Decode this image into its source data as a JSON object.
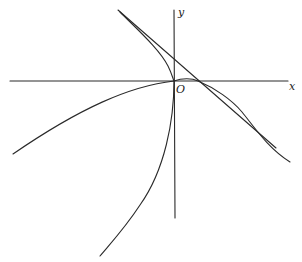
{
  "figure": {
    "type": "curve-sketch",
    "labels": {
      "x_axis": "x",
      "y_axis": "y",
      "origin": "O"
    },
    "colors": {
      "stroke": "#2a2a2a",
      "background": "#ffffff"
    },
    "elements": [
      {
        "name": "x-axis",
        "kind": "axis"
      },
      {
        "name": "y-axis",
        "kind": "axis"
      },
      {
        "name": "tangent-line",
        "kind": "straight line crossing x-axis right of origin"
      },
      {
        "name": "upper-right-branch",
        "kind": "curve from upper-left through origin, bump, descending right"
      },
      {
        "name": "left-branch",
        "kind": "curve from origin toward lower-left"
      },
      {
        "name": "lower-branch",
        "kind": "curve from origin toward bottom"
      }
    ]
  }
}
